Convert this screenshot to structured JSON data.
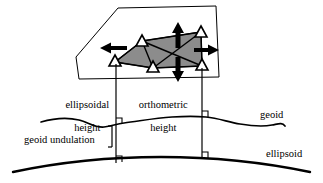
{
  "diagram": {
    "type": "geodesy-height-diagram",
    "labels": {
      "ellipsoidal_height": "ellipsoidal\nheight",
      "ellipsoidal_height_line1": "ellipsoidal",
      "ellipsoidal_height_line2": "height",
      "orthometric_height": "orthometric\nheight",
      "orthometric_height_line1": "orthometric",
      "orthometric_height_line2": "height",
      "geoid_undulation": "geoid undulation",
      "geoid": "geoid",
      "ellipsoid": "ellipsoid"
    },
    "colors": {
      "stroke": "#000000",
      "network_fill": "#8c8c8c",
      "plane_fill": "#ffffff",
      "background": "#ffffff"
    },
    "network": {
      "name": "triangulation-network",
      "station_count": 5,
      "stations": [
        {
          "id": "station-1",
          "x": 115,
          "y": 62,
          "marker": "triangle"
        },
        {
          "id": "station-2",
          "x": 142,
          "y": 41,
          "marker": "triangle"
        },
        {
          "id": "station-3",
          "x": 153,
          "y": 68,
          "marker": "triangle"
        },
        {
          "id": "station-4",
          "x": 201,
          "y": 32,
          "marker": "triangle"
        },
        {
          "id": "station-5",
          "x": 202,
          "y": 66,
          "marker": "triangle"
        }
      ],
      "baselines": [
        {
          "from": "station-1",
          "to": "station-2"
        },
        {
          "from": "station-1",
          "to": "station-3"
        },
        {
          "from": "station-2",
          "to": "station-3"
        },
        {
          "from": "station-2",
          "to": "station-4"
        },
        {
          "from": "station-3",
          "to": "station-5"
        },
        {
          "from": "station-4",
          "to": "station-5"
        },
        {
          "from": "station-2",
          "to": "station-5"
        },
        {
          "from": "station-3",
          "to": "station-4"
        }
      ],
      "expansion_arrows": [
        {
          "id": "arrow-left",
          "direction": "left",
          "x": 110,
          "y": 48
        },
        {
          "id": "arrow-up",
          "direction": "up",
          "x": 178,
          "y": 30
        },
        {
          "id": "arrow-right",
          "direction": "right",
          "x": 208,
          "y": 50
        },
        {
          "id": "arrow-down",
          "direction": "down",
          "x": 178,
          "y": 72
        }
      ]
    },
    "plane": {
      "name": "reference-plane-outline",
      "points": "118,8 216,6 219,77 79,79 76,57"
    },
    "verticals": [
      {
        "id": "vertical-left",
        "x": 116,
        "top": 62,
        "bottom": 162
      },
      {
        "id": "vertical-right",
        "x": 202,
        "top": 66,
        "bottom": 158
      }
    ],
    "right_angle_markers": [
      {
        "id": "right-angle-geoid-left",
        "x": 116,
        "y": 123
      },
      {
        "id": "right-angle-geoid-right",
        "x": 202,
        "y": 116
      },
      {
        "id": "right-angle-ellipsoid-left",
        "x": 116,
        "y": 162
      },
      {
        "id": "right-angle-ellipsoid-right",
        "x": 202,
        "y": 158
      }
    ],
    "surfaces": {
      "geoid": {
        "name": "geoid-surface",
        "path": "M 41,122 C 55,118 66,117 79,120 C 88,122 95,128 104,127 C 112,126 116,124 124,123 C 140,121 155,118 172,117 C 186,116 196,116 206,117 C 218,118 228,122 240,124 C 252,126 262,127 272,125 C 278,124 282,122 285,126"
      },
      "ellipsoid": {
        "name": "ellipsoid-surface",
        "path": "M 13,172 C 60,162 110,157 161,157 C 212,157 262,162 310,172"
      }
    },
    "leader_lines": [
      {
        "id": "undulation-leader",
        "from_x": 116,
        "from_y": 124,
        "to_x": 116,
        "to_y": 144
      }
    ]
  }
}
